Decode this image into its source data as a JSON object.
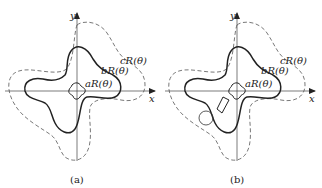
{
  "figure": {
    "panels": [
      {
        "id": "a",
        "caption": "(a)",
        "axes": {
          "x_label": "x",
          "y_label": "y"
        },
        "curves": [
          {
            "label": "aR(θ)",
            "style": "solid",
            "role": "inner small four-lobed contour"
          },
          {
            "label": "bR(θ)",
            "style": "solid-bold",
            "role": "middle four-lobed contour"
          },
          {
            "label": "cR(θ)",
            "style": "dashed",
            "role": "outer four-lobed contour"
          }
        ],
        "obstacles": []
      },
      {
        "id": "b",
        "caption": "(b)",
        "axes": {
          "x_label": "x",
          "y_label": "y"
        },
        "curves": [
          {
            "label": "aR(θ)",
            "style": "solid",
            "role": "inner small four-lobed contour"
          },
          {
            "label": "bR(θ)",
            "style": "solid-bold",
            "role": "middle four-lobed contour"
          },
          {
            "label": "cR(θ)",
            "style": "dashed",
            "role": "outer four-lobed contour"
          }
        ],
        "obstacles": [
          {
            "shape": "quadrilateral",
            "position": "lower-left, inside bR contour"
          },
          {
            "shape": "circle",
            "position": "lower-left, between bR and cR contours"
          }
        ]
      }
    ]
  },
  "colors": {
    "line": "#222222",
    "axis": "#444444",
    "dashed": "#555555"
  }
}
